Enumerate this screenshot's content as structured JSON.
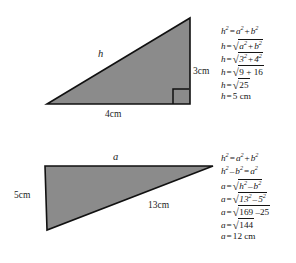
{
  "document": {
    "title": "Pythagorean theorem worked examples",
    "background_color": "#ffffff",
    "ink_color": "#141414"
  },
  "figures": [
    {
      "id": "triangle-top",
      "name": "right-triangle-find-hypotenuse",
      "fill_color": "#8b8b8b",
      "stroke_color": "#111111",
      "right_angle_marked": true,
      "labels": {
        "hypotenuse": "h",
        "vertical_leg": "3cm",
        "horizontal_leg": "4cm"
      }
    },
    {
      "id": "triangle-bottom",
      "name": "right-triangle-find-leg",
      "fill_color": "#8b8b8b",
      "stroke_color": "#111111",
      "right_angle_marked": false,
      "labels": {
        "top_leg": "a",
        "vertical_leg": "5cm",
        "hypotenuse": "13cm"
      }
    }
  ],
  "equations": {
    "top": {
      "name": "solve-for-hypotenuse",
      "lines": [
        "h² = a² + b²",
        "h = √(a² + b²)",
        "h = √(3² + 4²)",
        "h = √(9 + 16)",
        "h = √25",
        "h = 5 cm"
      ],
      "parts": {
        "l1": {
          "lhs": "h",
          "lhs_exp": "2",
          "eq": "=",
          "t1": "a",
          "t1_exp": "2",
          "plus": "+",
          "t2": "b",
          "t2_exp": "2"
        },
        "l2": {
          "lhs": "h",
          "eq": "=",
          "radicand_a": "a",
          "radicand_a_exp": "2",
          "plus": "+",
          "radicand_b": "b",
          "radicand_b_exp": "2"
        },
        "l3": {
          "lhs": "h",
          "eq": "=",
          "radicand_a": "3",
          "radicand_a_exp": "2",
          "plus": "+",
          "radicand_b": "4",
          "radicand_b_exp": "2"
        },
        "l4": {
          "lhs": "h",
          "eq": "=",
          "radicand": "9 + 16"
        },
        "l5": {
          "lhs": "h",
          "eq": "=",
          "radicand": "25"
        },
        "l6": {
          "lhs": "h",
          "eq": "=",
          "value": "5",
          "unit": "cm"
        }
      }
    },
    "bottom": {
      "name": "solve-for-leg",
      "lines": [
        "h² = a² + b²",
        "h² − b² = a²",
        "a = √(h² − b²)",
        "a = √(13² − 5²)",
        "a = √(169 − 25)",
        "a = √144",
        "a = 12 cm"
      ],
      "parts": {
        "l1": {
          "lhs": "h",
          "lhs_exp": "2",
          "eq": "=",
          "t1": "a",
          "t1_exp": "2",
          "plus": "+",
          "t2": "b",
          "t2_exp": "2"
        },
        "l2": {
          "lhs": "h",
          "lhs_exp": "2",
          "minus": "–",
          "t1": "b",
          "t1_exp": "2",
          "eq": "=",
          "t2": "a",
          "t2_exp": "2"
        },
        "l3": {
          "lhs": "a",
          "eq": "=",
          "radicand_a": "h",
          "radicand_a_exp": "2",
          "minus": "–",
          "radicand_b": "b",
          "radicand_b_exp": "2"
        },
        "l4": {
          "lhs": "a",
          "eq": "=",
          "radicand_a": "13",
          "radicand_a_exp": "2",
          "minus": "–",
          "radicand_b": "5",
          "radicand_b_exp": "2"
        },
        "l5": {
          "lhs": "a",
          "eq": "=",
          "radicand": "169 –25"
        },
        "l6": {
          "lhs": "a",
          "eq": "=",
          "radicand": "144"
        },
        "l7": {
          "lhs": "a",
          "eq": "=",
          "value": "12",
          "unit": "cm"
        }
      }
    }
  },
  "glyphs": {
    "radical": "√",
    "equals": "=",
    "plus": "+",
    "minus": "–"
  }
}
